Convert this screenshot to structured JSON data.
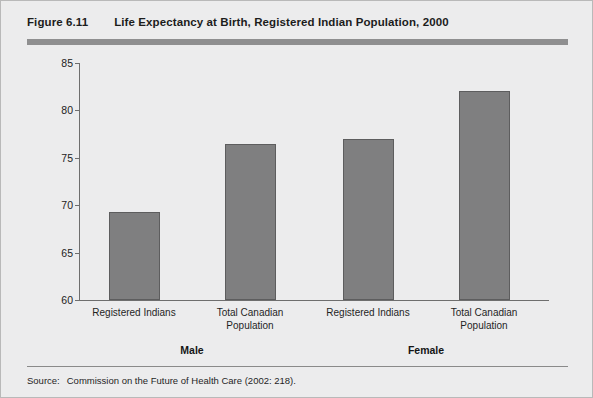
{
  "figure": {
    "number": "Figure 6.11",
    "title": "Life Expectancy at Birth, Registered Indian Population, 2000",
    "source_label": "Source:",
    "source_text": "Commission on the Future of Health Care (2002: 218)."
  },
  "colors": {
    "panel_background": "#ececed",
    "panel_border": "#b9b9b9",
    "header_rule": "#8f8f90",
    "bar_fill": "#7f7f80",
    "bar_stroke": "#5d5d5e",
    "axis": "#6e6e6e",
    "text": "#1f1f1f"
  },
  "chart_data": {
    "type": "bar",
    "title": "Life Expectancy at Birth, Registered Indian Population, 2000",
    "xlabel": "",
    "ylabel": "",
    "ylim": [
      60,
      85
    ],
    "yticks": [
      60,
      65,
      70,
      75,
      80,
      85
    ],
    "ytick_labels": [
      "60",
      "65",
      "70",
      "75",
      "80",
      "85"
    ],
    "grid": false,
    "legend": "none",
    "categories": [
      "Registered Indians",
      "Total Canadian\nPopulation",
      "Registered Indians",
      "Total Canadian\nPopulation"
    ],
    "groups": [
      "Male",
      "Female"
    ],
    "values": [
      69.3,
      76.5,
      77.0,
      82.0
    ],
    "bars": [
      {
        "group": "Male",
        "category_line1": "Registered Indians",
        "category_line2": "",
        "value": 69.3
      },
      {
        "group": "Male",
        "category_line1": "Total Canadian",
        "category_line2": "Population",
        "value": 76.5
      },
      {
        "group": "Female",
        "category_line1": "Registered Indians",
        "category_line2": "",
        "value": 77.0
      },
      {
        "group": "Female",
        "category_line1": "Total Canadian",
        "category_line2": "Population",
        "value": 82.0
      }
    ]
  }
}
